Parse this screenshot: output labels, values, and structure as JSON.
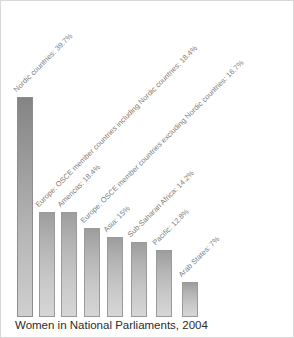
{
  "chart_data": {
    "type": "bar",
    "title": "Women in National Parliaments, 2004",
    "xlabel": "",
    "ylabel": "",
    "ylim": [
      0,
      42
    ],
    "grid": false,
    "legend": "none",
    "value_unit": "%",
    "categories": [
      "Nordic countries",
      "Europe: OSCE member countries including Nordic countries",
      "Americas",
      "Europe: OSCE member countries excluding Nordic countries",
      "Asia",
      "Sub-Saharan Africa",
      "Pacific",
      "Arab States"
    ],
    "values": [
      39.7,
      18.4,
      18.4,
      16.7,
      15,
      14.2,
      12.8,
      7
    ],
    "tick_labels": [
      "Nordic countries: 39.7%",
      "Europe: OSCE member countries including Nordic countries: 18.4%",
      "Americas: 18.4%",
      "Europe: OSCE member countries excluding Nordic countries: 16.7%",
      "Asia: 15%",
      "Sub-Saharan Africa: 14.2%",
      "Pacific: 12.8%",
      "Arab States: 7%"
    ],
    "colors": {
      "bar_highlight": "#9a9a9a",
      "bar_default": "#c0c0c0",
      "bar_border": "#9a9a9a",
      "label_text": "#7c7c7c",
      "title_text": "#2b2b2b",
      "background": "#ffffff",
      "figure_border": "#d8d8d8"
    }
  },
  "bars": [
    {
      "label": "Nordic countries: 39.7%",
      "value": 39.7,
      "left": 16,
      "width": 16,
      "top": 96,
      "label_x": 17,
      "label_y": 93,
      "highlight": true
    },
    {
      "label": "Europe: OSCE member countries including Nordic countries: 18.4%",
      "value": 18.4,
      "left": 38,
      "width": 16,
      "top": 211,
      "label_x": 39,
      "label_y": 208,
      "highlight": false
    },
    {
      "label": "Americas: 18.4%",
      "value": 18.4,
      "left": 60,
      "width": 16,
      "top": 211,
      "label_x": 61,
      "label_y": 208,
      "highlight": false
    },
    {
      "label": "Europe: OSCE member countries excluding Nordic countries: 16.7%",
      "value": 16.7,
      "left": 83,
      "width": 16,
      "top": 227,
      "label_x": 84,
      "label_y": 224,
      "highlight": false
    },
    {
      "label": "Asia: 15%",
      "value": 15,
      "left": 106,
      "width": 16,
      "top": 236,
      "label_x": 107,
      "label_y": 233,
      "highlight": false
    },
    {
      "label": "Sub-Saharan Africa: 14.2%",
      "value": 14.2,
      "left": 130,
      "width": 16,
      "top": 241,
      "label_x": 131,
      "label_y": 238,
      "highlight": false
    },
    {
      "label": "Pacific: 12.8%",
      "value": 12.8,
      "left": 155,
      "width": 16,
      "top": 249,
      "label_x": 156,
      "label_y": 246,
      "highlight": false
    },
    {
      "label": "Arab States: 7%",
      "value": 7,
      "left": 181,
      "width": 16,
      "top": 281,
      "label_x": 182,
      "label_y": 278,
      "highlight": false
    }
  ],
  "baseline_y": 316
}
